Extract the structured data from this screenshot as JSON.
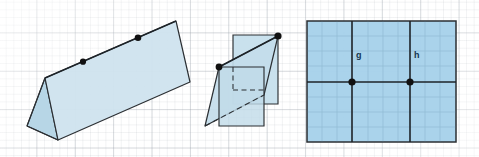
{
  "page": {
    "background_color": "#ffffff",
    "grid_color": "#969ea8"
  },
  "palette": {
    "fill_light": "#cfe3ee",
    "fill_mid": "#bcd9e8",
    "fill_right": "#a7d2ea",
    "fill_shadow": "#b3d4e6",
    "stroke": "#2b2f33",
    "stroke_dark": "#1d2328",
    "dot": "#111111",
    "label_text": "#16364f"
  },
  "figures": [
    {
      "id": "figure-1",
      "name": "folded-card-tent",
      "description": "Two planes meeting along a ridge, drawn as a tent / folded card",
      "points": [],
      "labels": []
    },
    {
      "id": "figure-2",
      "name": "intersecting-planes",
      "description": "Two plane rectangles passing through one another with hidden edges dashed",
      "points": [],
      "labels": []
    },
    {
      "id": "figure-3",
      "name": "plane-with-two-lines",
      "description": "A single shaded plane crossed by two lines labelled g and h and a third horizontal line",
      "labels": [
        {
          "text": "g",
          "x": 356,
          "y": 55
        },
        {
          "text": "h",
          "x": 414,
          "y": 55
        }
      ]
    }
  ],
  "line_labels": {
    "g": "g",
    "h": "h"
  }
}
